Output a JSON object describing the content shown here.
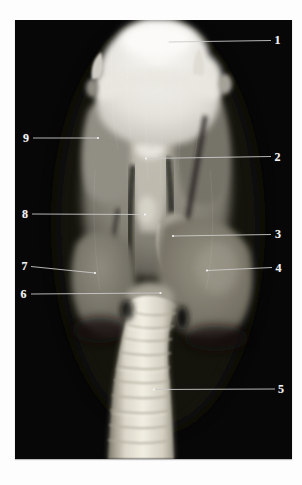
{
  "figure": {
    "photo": {
      "background": "#070707",
      "left": 15,
      "top": 20,
      "width": 277,
      "height": 439
    },
    "style": {
      "label_color": "#f2f2f2",
      "leader_line_color": "#c9c9c9",
      "tip_dot_color": "#f5f5f5"
    },
    "labels": [
      {
        "number": "1",
        "x": 277.5,
        "y": 40,
        "tip": [
          168,
          42
        ],
        "end": [
          271,
          40.5
        ]
      },
      {
        "number": "2",
        "x": 277.5,
        "y": 157,
        "tip": [
          146,
          158.5
        ],
        "end": [
          271,
          156.5
        ]
      },
      {
        "number": "3",
        "x": 278,
        "y": 234,
        "tip": [
          173,
          236
        ],
        "end": [
          271,
          234.5
        ]
      },
      {
        "number": "4",
        "x": 278.5,
        "y": 267.5,
        "tip": [
          207,
          270.5
        ],
        "end": [
          272,
          267.5
        ]
      },
      {
        "number": "5",
        "x": 281,
        "y": 389,
        "tip": [
          154,
          389.5
        ],
        "end": [
          275,
          389
        ]
      },
      {
        "number": "6",
        "x": 23.5,
        "y": 293.5,
        "tip": [
          160.5,
          293
        ],
        "end": [
          31,
          294
        ]
      },
      {
        "number": "7",
        "x": 24.5,
        "y": 266,
        "tip": [
          95,
          273
        ],
        "end": [
          31,
          266.5
        ]
      },
      {
        "number": "8",
        "x": 25,
        "y": 214,
        "tip": [
          145,
          214.5
        ],
        "end": [
          32,
          214
        ]
      },
      {
        "number": "9",
        "x": 26,
        "y": 138,
        "tip": [
          98,
          138
        ],
        "end": [
          33,
          138
        ]
      }
    ]
  }
}
